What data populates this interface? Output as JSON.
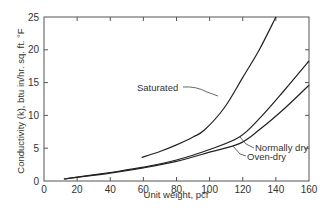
{
  "chart_data": {
    "type": "line",
    "title": "",
    "xlabel": "Unit weight, pcf",
    "ylabel": "Conductivity (k), btu in/hr. sq. ft. °F",
    "xlim": [
      0,
      160
    ],
    "ylim": [
      0,
      25
    ],
    "xticks": [
      0,
      20,
      40,
      60,
      80,
      100,
      120,
      140,
      160
    ],
    "yticks": [
      0,
      5,
      10,
      15,
      20,
      25
    ],
    "grid": false,
    "legend_position": "inline annotations",
    "series": [
      {
        "name": "Saturated",
        "points": [
          [
            59,
            3.6
          ],
          [
            70,
            4.5
          ],
          [
            80,
            5.5
          ],
          [
            90,
            6.7
          ],
          [
            97,
            7.8
          ],
          [
            109,
            11.2
          ],
          [
            120,
            15.8
          ],
          [
            130,
            20.0
          ],
          [
            140,
            25.0
          ]
        ]
      },
      {
        "name": "Normally dry",
        "points": [
          [
            12,
            0.3
          ],
          [
            20,
            0.6
          ],
          [
            40,
            1.3
          ],
          [
            60,
            2.1
          ],
          [
            80,
            3.2
          ],
          [
            100,
            4.8
          ],
          [
            118,
            6.7
          ],
          [
            130,
            9.5
          ],
          [
            145,
            13.8
          ],
          [
            160,
            18.3
          ]
        ]
      },
      {
        "name": "Oven-dry",
        "points": [
          [
            12,
            0.3
          ],
          [
            20,
            0.55
          ],
          [
            40,
            1.2
          ],
          [
            60,
            2.0
          ],
          [
            80,
            3.0
          ],
          [
            100,
            4.4
          ],
          [
            118,
            5.7
          ],
          [
            130,
            7.8
          ],
          [
            145,
            11.0
          ],
          [
            160,
            14.6
          ]
        ]
      }
    ],
    "annotations": [
      {
        "text": "Saturated",
        "at": [
          112,
          11.8
        ]
      },
      {
        "text": "Normally dry",
        "at": [
          118,
          6.7
        ]
      },
      {
        "text": "Oven-dry",
        "at": [
          112,
          5.1
        ]
      }
    ]
  },
  "labels": {
    "saturated": "Saturated",
    "normally_dry": "Normally dry",
    "oven_dry": "Oven-dry",
    "xlabel": "Unit weight, pcf",
    "ylabel": "Conductivity (k), btu in/hr. sq. ft. °F"
  },
  "colors": {
    "line": "#222222",
    "axis": "#555555",
    "text": "#333333",
    "background": "#ffffff"
  }
}
